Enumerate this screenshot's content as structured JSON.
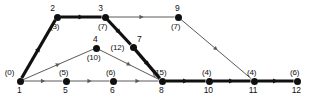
{
  "figure": {
    "kind": "activity-network-diagram",
    "width": 310,
    "height": 104,
    "background_color": "#ffffff",
    "critical_path_color": "#101010",
    "normal_edge_color": "#5a5a5a",
    "node_color": "#101010"
  },
  "chart_data": {
    "type": "diagram",
    "title": "",
    "xlabel": "",
    "ylabel": "",
    "nodes": [
      {
        "id": "1",
        "label": "1",
        "time": "(0)",
        "x": 20,
        "y": 81,
        "id_pos": "below",
        "time_pos": "above-left"
      },
      {
        "id": "2",
        "label": "2",
        "time": "(3)",
        "x": 57,
        "y": 17,
        "id_pos": "above-left",
        "time_pos": "below"
      },
      {
        "id": "3",
        "label": "3",
        "time": "(7)",
        "x": 105,
        "y": 17,
        "id_pos": "above-left",
        "time_pos": "below"
      },
      {
        "id": "4",
        "label": "4",
        "time": "(10)",
        "x": 96,
        "y": 48,
        "id_pos": "above",
        "time_pos": "below"
      },
      {
        "id": "5",
        "label": "5",
        "time": "(5)",
        "x": 66,
        "y": 81,
        "id_pos": "below",
        "time_pos": "above"
      },
      {
        "id": "6",
        "label": "6",
        "time": "(6)",
        "x": 113,
        "y": 81,
        "id_pos": "below",
        "time_pos": "above"
      },
      {
        "id": "7",
        "label": "7",
        "time": "(12)",
        "x": 133,
        "y": 47,
        "id_pos": "above-right",
        "time_pos": "left"
      },
      {
        "id": "8",
        "label": "8",
        "time": "(15)",
        "x": 162,
        "y": 81,
        "id_pos": "below",
        "time_pos": "above"
      },
      {
        "id": "9",
        "label": "9",
        "time": "(7)",
        "x": 178,
        "y": 17,
        "id_pos": "above",
        "time_pos": "below"
      },
      {
        "id": "10",
        "label": "10",
        "time": "(4)",
        "x": 209,
        "y": 81,
        "id_pos": "below",
        "time_pos": "above"
      },
      {
        "id": "11",
        "label": "11",
        "time": "(4)",
        "x": 254,
        "y": 81,
        "id_pos": "below",
        "time_pos": "above"
      },
      {
        "id": "12",
        "label": "12",
        "time": "(6)",
        "x": 297,
        "y": 81,
        "id_pos": "below",
        "time_pos": "above"
      }
    ],
    "edges": [
      {
        "from": "1",
        "to": "2",
        "critical": true
      },
      {
        "from": "2",
        "to": "3",
        "critical": true
      },
      {
        "from": "3",
        "to": "7",
        "critical": true
      },
      {
        "from": "7",
        "to": "8",
        "critical": true
      },
      {
        "from": "8",
        "to": "10",
        "critical": true
      },
      {
        "from": "10",
        "to": "11",
        "critical": true
      },
      {
        "from": "11",
        "to": "12",
        "critical": true
      },
      {
        "from": "1",
        "to": "4",
        "critical": false
      },
      {
        "from": "1",
        "to": "5",
        "critical": false
      },
      {
        "from": "3",
        "to": "9",
        "critical": false
      },
      {
        "from": "4",
        "to": "8",
        "critical": false
      },
      {
        "from": "5",
        "to": "6",
        "critical": false
      },
      {
        "from": "6",
        "to": "8",
        "critical": false
      },
      {
        "from": "9",
        "to": "11",
        "critical": false
      }
    ]
  }
}
